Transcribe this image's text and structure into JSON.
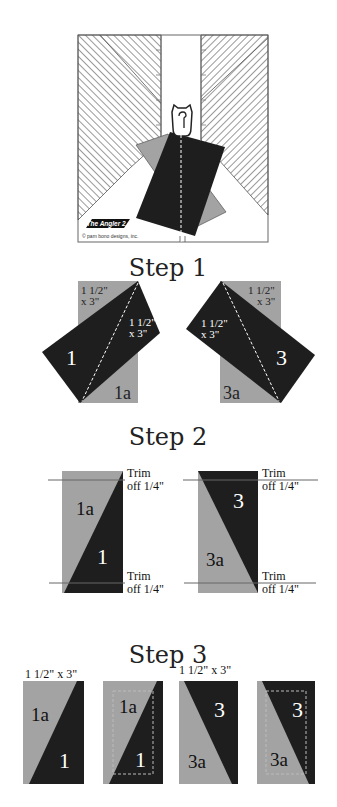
{
  "colors": {
    "dark": "#1e1e1e",
    "gray": "#a3a3a3",
    "hatch": "#555555",
    "line": "#444444"
  },
  "ruler_figure": {
    "logo_text": "The Angler 2.",
    "copyright": "© pam bono designs, inc."
  },
  "step1": {
    "title": "Step 1",
    "left": {
      "gray_size_line1": "1 1/2\"",
      "gray_size_line2": "x 3\"",
      "dark_size_line1": "1 1/2\"",
      "dark_size_line2": "x 3\"",
      "dark_label": "1",
      "gray_label": "1a"
    },
    "right": {
      "gray_size_line1": "1 1/2\"",
      "gray_size_line2": "x 3\"",
      "dark_size_line1": "1 1/2\"",
      "dark_size_line2": "x 3\"",
      "dark_label": "3",
      "gray_label": "3a"
    }
  },
  "step2": {
    "title": "Step 2",
    "left": {
      "gray_label": "1a",
      "dark_label": "1",
      "trim_top_line1": "Trim",
      "trim_top_line2": "off 1/4\"",
      "trim_bottom_line1": "Trim",
      "trim_bottom_line2": "off 1/4\""
    },
    "right": {
      "gray_label": "3a",
      "dark_label": "3",
      "trim_top_line1": "Trim",
      "trim_top_line2": "off 1/4\"",
      "trim_bottom_line1": "Trim",
      "trim_bottom_line2": "off 1/4\""
    }
  },
  "step3": {
    "title": "Step 3",
    "size_left": "1 1/2\" x 3\"",
    "size_right": "1 1/2\" x 3\"",
    "panels": [
      {
        "gray_label": "1a",
        "dark_label": "1"
      },
      {
        "gray_label": "1a",
        "dark_label": "1"
      },
      {
        "gray_label": "3a",
        "dark_label": "3"
      },
      {
        "gray_label": "3a",
        "dark_label": "3"
      }
    ]
  }
}
